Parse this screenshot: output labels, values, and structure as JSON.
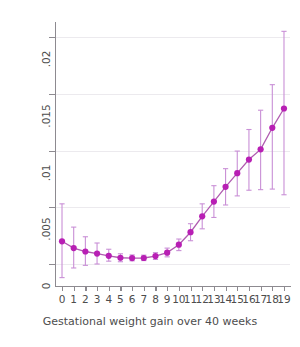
{
  "chart_data": {
    "type": "scatter",
    "title": "",
    "xlabel": "Gestational weight gain over 40 weeks",
    "ylabel": "Probability of macrosomia",
    "xlim": [
      -0.6,
      19.6
    ],
    "ylim": [
      -0.0017,
      0.0215
    ],
    "grid": true,
    "legend": null,
    "x_tick_labels": [
      "0",
      "1",
      "2",
      "3",
      "4",
      "5",
      "6",
      "7",
      "8",
      "9",
      "10",
      "11",
      "12",
      "13",
      "14",
      "15",
      "16",
      "17",
      "18",
      "19"
    ],
    "y_tick_labels": [
      "0",
      ".005",
      ".01",
      ".015",
      ".02"
    ],
    "y_tick_values": [
      0,
      0.005,
      0.01,
      0.015,
      0.02
    ],
    "marker_color": "#b81fb4",
    "line_color": "#b05bb0",
    "errorbar_color": "#c98fd6",
    "axis_color": "#8d8a90",
    "grid_color": "#eceaee",
    "text_color": "#4d4d4d",
    "x": [
      0,
      1,
      2,
      3,
      4,
      5,
      6,
      7,
      8,
      9,
      10,
      11,
      12,
      13,
      14,
      15,
      16,
      17,
      18,
      19
    ],
    "values": [
      0.002,
      0.0014,
      0.0011,
      0.00092,
      0.00072,
      0.00055,
      0.00052,
      0.00053,
      0.0007,
      0.001,
      0.0017,
      0.0028,
      0.0042,
      0.0055,
      0.0068,
      0.008,
      0.0092,
      0.0101,
      0.012,
      0.0137
    ],
    "error_low": [
      -0.0012,
      -0.00035,
      -0.00012,
      0.0,
      0.00025,
      0.0002,
      0.00028,
      0.0003,
      0.0004,
      0.00063,
      0.00118,
      0.00205,
      0.0031,
      0.0041,
      0.0052,
      0.006,
      0.0065,
      0.00655,
      0.0066,
      0.0061
    ],
    "error_high": [
      0.0053,
      0.00325,
      0.0024,
      0.00185,
      0.0013,
      0.0009,
      0.0008,
      0.00078,
      0.001,
      0.0014,
      0.0022,
      0.00355,
      0.0053,
      0.0069,
      0.0084,
      0.00995,
      0.01185,
      0.01355,
      0.0158,
      0.0205
    ],
    "series_name": "Predicted probability of macrosomia"
  },
  "axis": {
    "y_title": "Probability of macrosomia",
    "x_title": "Gestational weight gain over 40 weeks"
  }
}
